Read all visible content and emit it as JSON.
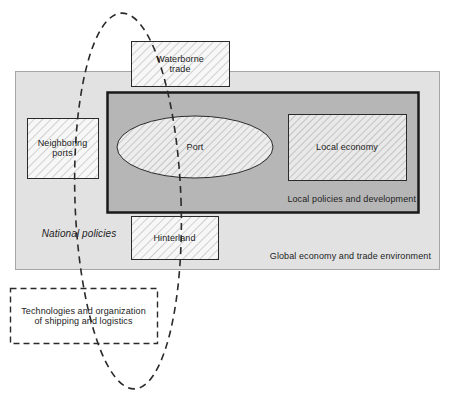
{
  "diagram": {
    "containers": [
      {
        "id": "global",
        "label": "Global economy and trade environment",
        "fill": "#e0e0e0",
        "border": "#9a9a9a"
      },
      {
        "id": "local_policies",
        "label": "Local policies and development",
        "fill": "#b4b4b4",
        "border": "#1a1a1a"
      }
    ],
    "free_labels": [
      {
        "id": "national_policies",
        "label": "National policies",
        "style": "italic"
      }
    ],
    "boxes": [
      {
        "id": "waterborne_trade",
        "label": "Waterborne\ntrade",
        "line1": "Waterborne",
        "line2": "trade",
        "hatched": true
      },
      {
        "id": "neighboring_ports",
        "label": "Neighboring\nports",
        "line1": "Neighboring",
        "line2": "ports",
        "hatched": true
      },
      {
        "id": "local_economy",
        "label": "Local economy",
        "line1": "Local economy",
        "line2": "",
        "hatched": true
      },
      {
        "id": "hinterland",
        "label": "Hinterland",
        "line1": "Hinterland",
        "line2": "",
        "hatched": true
      },
      {
        "id": "technologies",
        "label": "Technologies and organization\nof shipping and logistics",
        "line1": "Technologies and organization",
        "line2": "of shipping and logistics",
        "hatched": false,
        "dashed": true
      }
    ],
    "ellipses": [
      {
        "id": "port",
        "label": "Port",
        "hatched": true
      },
      {
        "id": "shipping_logistics_loop",
        "label": "",
        "dashed": true
      }
    ],
    "colors": {
      "outer_fill": "#e0e0e0",
      "inner_fill": "#b4b4b4",
      "box_fill": "#f7f7f7",
      "hatch_line": "#9e9e9e",
      "stroke_dark": "#1a1a1a",
      "stroke_light": "#9a9a9a",
      "text": "#222222"
    }
  },
  "figure_caption": ""
}
